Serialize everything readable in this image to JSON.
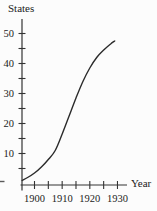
{
  "chart_data": {
    "type": "line",
    "title": "",
    "xlabel": "Year",
    "ylabel": "States",
    "xlim": [
      1895,
      1935
    ],
    "ylim": [
      0,
      55
    ],
    "grid": false,
    "legend": false,
    "x_tick_labels": [
      "1900",
      "1910",
      "1920",
      "1930"
    ],
    "x_tick_label_values": [
      1900,
      1910,
      1920,
      1930
    ],
    "x_ticks_all": [
      1900,
      1905,
      1910,
      1915,
      1920,
      1925,
      1930
    ],
    "y_tick_labels": [
      "10",
      "20",
      "30",
      "40",
      "50"
    ],
    "y_tick_label_values": [
      10,
      20,
      30,
      40,
      50
    ],
    "y_ticks_all": [
      5,
      10,
      15,
      20,
      25,
      30,
      35,
      40,
      45,
      50
    ],
    "curve_shape": "logistic-s-curve",
    "series": [
      {
        "name": "states-growth-curve",
        "x": [
          1895.5,
          1897.5,
          1900,
          1902.5,
          1905,
          1907.5,
          1910,
          1912.5,
          1915,
          1917.5,
          1920,
          1922.5,
          1925,
          1927.5,
          1929
        ],
        "y": [
          1,
          2,
          3.5,
          5.5,
          8,
          11,
          16.5,
          22.5,
          28.5,
          34,
          38.5,
          42,
          44.5,
          46.5,
          47.5
        ]
      }
    ]
  },
  "colors": {
    "ink": "#333333",
    "curve": "#2b2b2b",
    "text": "#1b1b1b",
    "background": "#fcfcfc"
  }
}
